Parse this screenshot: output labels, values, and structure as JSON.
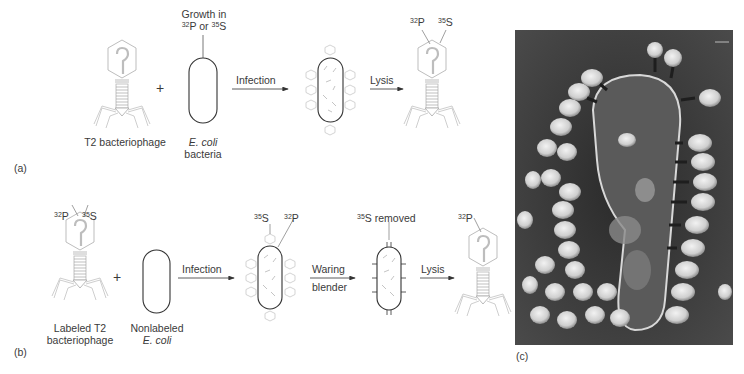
{
  "figure": {
    "panel_a": {
      "label": "(a)",
      "phage_label": "T2 bacteriophage",
      "plus": "+",
      "growth_label_line1": "Growth in",
      "growth_label_line2": {
        "iso1": "32",
        "el1": "P or ",
        "iso2": "35",
        "el2": "S"
      },
      "cell_label_line1": "E. coli",
      "cell_label_line2": "bacteria",
      "arrow1_label": "Infection",
      "arrow2_label": "Lysis",
      "result_labels": [
        {
          "iso": "32",
          "el": "P"
        },
        {
          "iso": "35",
          "el": "S"
        }
      ]
    },
    "panel_b": {
      "label": "(b)",
      "phage_labels": [
        {
          "iso": "32",
          "el": "P"
        },
        {
          "iso": "35",
          "el": "S"
        }
      ],
      "phage_label_line1": "Labeled T2",
      "phage_label_line2": "bacteriophage",
      "plus": "+",
      "cell_label_line1": "Nonlabeled",
      "cell_label_line2": "E. coli",
      "arrow1_label": "Infection",
      "infected_labels": [
        {
          "iso": "35",
          "el": "S"
        },
        {
          "iso": "32",
          "el": "P"
        }
      ],
      "arrow2_label_line1": "Waring",
      "arrow2_label_line2": "blender",
      "removed_label": {
        "iso": "35",
        "el": "S removed"
      },
      "arrow3_label": "Lysis",
      "result_label": {
        "iso": "32",
        "el": "P"
      }
    },
    "panel_c": {
      "label": "(c)",
      "description": "Electron micrograph of T2 phages attached to an E. coli cell"
    },
    "colors": {
      "phage_stroke": "#b8b8b8",
      "cell_stroke": "#333333",
      "arrow": "#333333",
      "text": "#3a3a3a",
      "micrograph_bg": "#3c3c3c"
    }
  }
}
